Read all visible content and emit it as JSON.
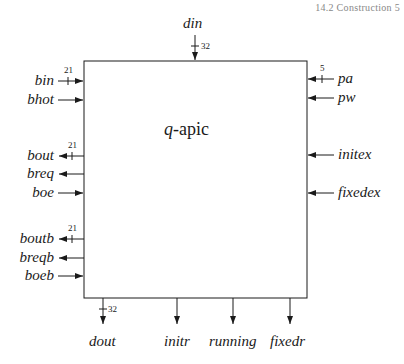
{
  "header": {
    "text": "14.2 Construction      5"
  },
  "module": {
    "name_italic": "q",
    "name_rest": "-apic"
  },
  "ports": {
    "top": [
      {
        "name": "din",
        "width": "32",
        "direction": "in"
      }
    ],
    "left": [
      {
        "name": "bin",
        "width": "21",
        "direction": "in"
      },
      {
        "name": "bhot",
        "direction": "in"
      },
      {
        "name": "bout",
        "width": "21",
        "direction": "out"
      },
      {
        "name": "breq",
        "direction": "out"
      },
      {
        "name": "boe",
        "direction": "in"
      },
      {
        "name": "boutb",
        "width": "21",
        "direction": "out"
      },
      {
        "name": "breqb",
        "direction": "out"
      },
      {
        "name": "boeb",
        "direction": "in"
      }
    ],
    "right": [
      {
        "name": "pa",
        "width": "5",
        "direction": "in"
      },
      {
        "name": "pw",
        "direction": "in"
      },
      {
        "name": "initex",
        "direction": "in"
      },
      {
        "name": "fixedex",
        "direction": "in"
      }
    ],
    "bottom": [
      {
        "name": "dout",
        "width": "32",
        "direction": "out"
      },
      {
        "name": "initr",
        "direction": "out"
      },
      {
        "name": "running",
        "direction": "out"
      },
      {
        "name": "fixedr",
        "direction": "out"
      }
    ]
  }
}
